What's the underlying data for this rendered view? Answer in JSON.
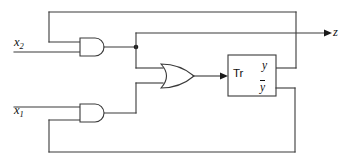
{
  "diagram": {
    "type": "logic-circuit-schematic",
    "width": 353,
    "height": 163,
    "background_color": "#ffffff",
    "line_color": "#3a3a3a",
    "text_color": "#111111"
  },
  "inputs": [
    {
      "id": "x2",
      "label": "x",
      "subscript": "2",
      "x": 14,
      "y": 36
    },
    {
      "id": "x1",
      "label": "x",
      "subscript": "1",
      "x": 14,
      "y": 104
    }
  ],
  "outputs": [
    {
      "id": "z",
      "label": "z",
      "x": 333,
      "y": 26
    }
  ],
  "blocks": [
    {
      "id": "tr",
      "label": "Tr",
      "kind": "flip-flop",
      "x": 228,
      "y": 55,
      "width": 48,
      "height": 41,
      "port_labels": [
        {
          "id": "y",
          "label": "y",
          "overbar": false
        },
        {
          "id": "ybar",
          "label": "y",
          "overbar": true
        }
      ]
    }
  ],
  "gates": [
    {
      "id": "and-top",
      "kind": "AND",
      "x": 78,
      "y": 38,
      "width": 32,
      "height": 18
    },
    {
      "id": "or-mid",
      "kind": "OR",
      "x": 160,
      "y": 66,
      "width": 34,
      "height": 20
    },
    {
      "id": "and-bottom",
      "kind": "AND",
      "x": 78,
      "y": 106,
      "width": 32,
      "height": 18
    }
  ],
  "junctions": [
    {
      "id": "fanout-and-top-output",
      "x": 136,
      "y": 47
    }
  ],
  "nets": [
    {
      "id": "net-x2-to-and-top",
      "from": "x2",
      "to": "and-top.in1"
    },
    {
      "id": "net-y-feedback-to-and-top",
      "from": "tr.y",
      "to": "and-top.in0"
    },
    {
      "id": "net-and-top-to-or",
      "from": "and-top.out",
      "to": "or-mid.in0"
    },
    {
      "id": "net-and-top-to-z",
      "from": "and-top.out",
      "to": "z"
    },
    {
      "id": "net-x1-to-and-bottom",
      "from": "x1",
      "to": "and-bottom.in0"
    },
    {
      "id": "net-ybar-feedback-to-and-bottom",
      "from": "tr.ybar",
      "to": "and-bottom.in1"
    },
    {
      "id": "net-and-bottom-to-or",
      "from": "and-bottom.out",
      "to": "or-mid.in1"
    },
    {
      "id": "net-or-to-tr",
      "from": "or-mid.out",
      "to": "tr.in"
    }
  ]
}
